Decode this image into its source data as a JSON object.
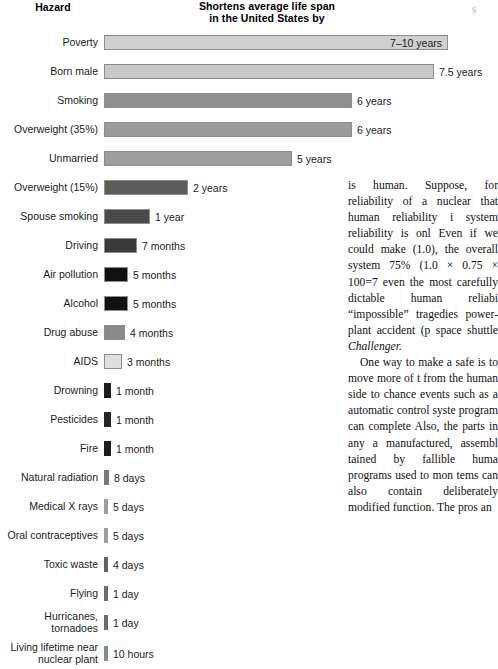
{
  "figure": {
    "header": {
      "hazard_label": "Hazard",
      "measure_line1": "Shortens average life span",
      "measure_line2": "in the United States by"
    }
  },
  "chart_data": {
    "type": "bar",
    "title": "Shortens average life span in the United States by",
    "xlabel": "",
    "ylabel": "Hazard",
    "orientation": "horizontal",
    "grid": false,
    "legend": false,
    "unit_note": "Bar length encodes shortened life span; labels give the value in years, months, days or hours.",
    "categories": [
      "Poverty",
      "Born male",
      "Smoking",
      "Overweight (35%)",
      "Unmarried",
      "Overweight (15%)",
      "Spouse smoking",
      "Driving",
      "Air pollution",
      "Alcohol",
      "Drug abuse",
      "AIDS",
      "Drowning",
      "Pesticides",
      "Fire",
      "Natural radiation",
      "Medical X rays",
      "Oral contraceptives",
      "Toxic waste",
      "Flying",
      "Hurricanes, tornadoes",
      "Living lifetime near\nnuclear plant"
    ],
    "value_labels": [
      "7–10 years",
      "7.5 years",
      "6 years",
      "6 years",
      "5 years",
      "2 years",
      "1 year",
      "7 months",
      "5 months",
      "5 months",
      "4 months",
      "3 months",
      "1 month",
      "1 month",
      "1 month",
      "8 days",
      "5 days",
      "5 days",
      "4 days",
      "1 day",
      "1 day",
      "10 hours"
    ],
    "values_years": [
      8.5,
      7.5,
      6,
      6,
      5,
      2,
      1,
      0.583,
      0.417,
      0.417,
      0.333,
      0.25,
      0.0833,
      0.0833,
      0.0833,
      0.0219,
      0.0137,
      0.0137,
      0.011,
      0.0027,
      0.0027,
      0.0011
    ],
    "bar_px": [
      344,
      330,
      248,
      248,
      188,
      84,
      46,
      33,
      24,
      24,
      21,
      18,
      7,
      7,
      7,
      5,
      4,
      4,
      4,
      4,
      4,
      4
    ],
    "bar_colors": [
      "#cfcfcf",
      "#c9c9c9",
      "#8f8f8f",
      "#9a9a9a",
      "#9e9e9e",
      "#5c5c5c",
      "#4b4b4b",
      "#3a3a3a",
      "#111111",
      "#111111",
      "#8a8a8a",
      "#dedede",
      "#1a1a1a",
      "#262626",
      "#1d1d1d",
      "#7a7a7a",
      "#9d9d9d",
      "#9d9d9d",
      "#616161",
      "#6b6b6b",
      "#6b6b6b",
      "#8a8a8a"
    ],
    "label_inside_bar": [
      true,
      false,
      false,
      false,
      false,
      false,
      false,
      false,
      false,
      false,
      false,
      false,
      false,
      false,
      false,
      false,
      false,
      false,
      false,
      false,
      false,
      false
    ]
  },
  "body_text": {
    "paragraph1": "is human. Suppose, for reliability of a nuclear that human reliability i system reliability is onl Even if we could make (1.0), the overall system 75% (1.0 × 0.75 × 100=7 even the most carefully dictable human reliabi “impossible” tragedies power-plant accident (p space shuttle ",
    "paragraph1_italic": "Challenger.",
    "paragraph2": "One way to make a safe is to move more of t from the human side to chance events such as a automatic control syste program can complete Also, the parts in any a manufactured, assembl tained by fallible huma programs used to mon tems can also contain deliberately modified function. The pros an"
  },
  "edge_fragment": "s"
}
